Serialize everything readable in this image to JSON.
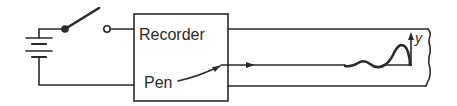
{
  "diagram": {
    "title": "",
    "labels": {
      "recorder": "Recorder",
      "pen": "Pen",
      "y_axis": "y"
    },
    "components": [
      {
        "id": "battery",
        "kind": "battery"
      },
      {
        "id": "switch",
        "kind": "switch",
        "state": "open"
      },
      {
        "id": "recorder",
        "kind": "box",
        "label": "Recorder"
      },
      {
        "id": "pen",
        "kind": "pointer",
        "label": "Pen"
      },
      {
        "id": "chart-paper",
        "kind": "paper-strip"
      },
      {
        "id": "trace",
        "kind": "waveform",
        "annotation": "y"
      }
    ],
    "colors": {
      "line": "#2a2a2a",
      "background": "#ffffff"
    }
  }
}
